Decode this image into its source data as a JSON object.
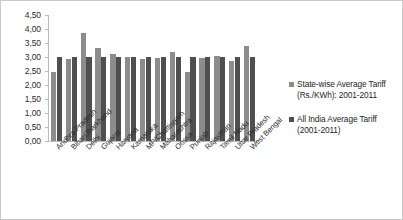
{
  "chart_data": {
    "type": "bar",
    "title": "",
    "xlabel": "",
    "ylabel": "",
    "ylim": [
      0,
      4.5
    ],
    "ytick_step": 0.5,
    "grid": false,
    "decimal_separator": ",",
    "legend_position": "right",
    "ytick_labels": [
      "4,50",
      "4,00",
      "3,50",
      "3,00",
      "2,50",
      "2,00",
      "1,50",
      "1,00",
      "0,50",
      "0,00"
    ],
    "categories": [
      "Andhra Pradesh",
      "Bihar/Jharkhand",
      "Delhi",
      "Gujarat",
      "Haryana",
      "Karnataka",
      "MP/Chattisgarh",
      "Maharashtra",
      "Orissa",
      "Punjab",
      "Rajasthan",
      "Tamil Nadu",
      "Uttar Pradesh",
      "West Bengal"
    ],
    "series": [
      {
        "name": "State-wise Average Tariff (Rs./KWh): 2001-2011",
        "color": "#8c8c8c",
        "values": [
          2.47,
          2.93,
          3.87,
          3.31,
          3.09,
          3.0,
          2.92,
          2.97,
          3.17,
          2.48,
          2.97,
          3.03,
          2.85,
          3.4
        ]
      },
      {
        "name": "All India Average Tariff (2001-2011)",
        "color": "#4f4f4f",
        "values": [
          3.0,
          3.0,
          3.0,
          3.0,
          3.0,
          3.0,
          3.0,
          3.0,
          3.0,
          3.0,
          3.0,
          3.0,
          3.0,
          3.0
        ]
      }
    ]
  },
  "legend": {
    "entries": [
      {
        "label": "State-wise Average Tariff (Rs./KWh): 2001-2011",
        "swatch": "light"
      },
      {
        "label": "All India Average Tariff (2001-2011)",
        "swatch": "dark"
      }
    ]
  }
}
